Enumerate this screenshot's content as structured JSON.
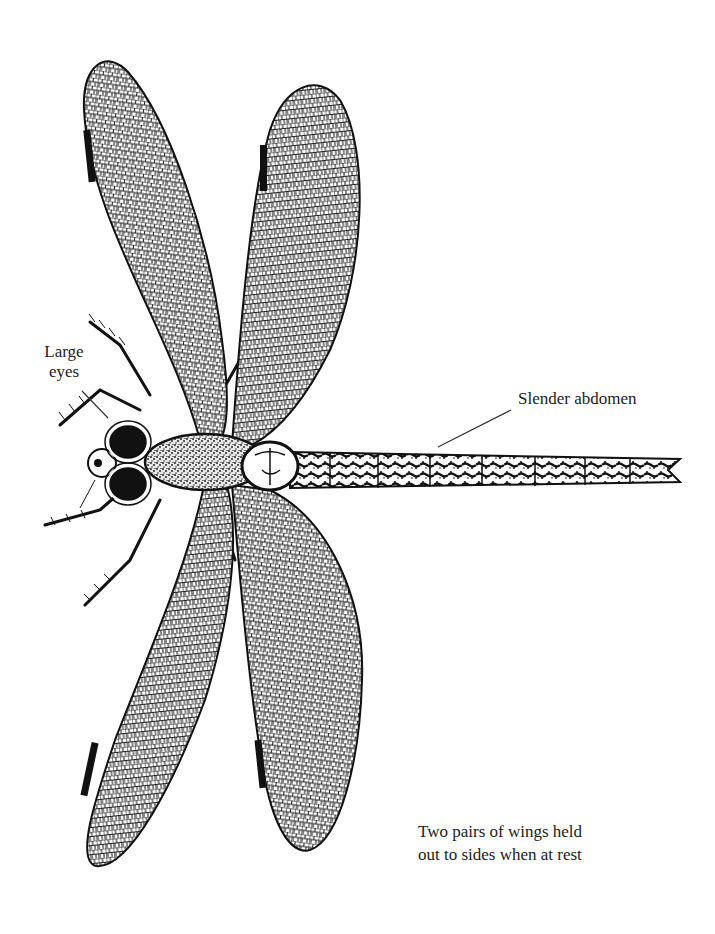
{
  "figure": {
    "colors": {
      "ink": "#111111",
      "background": "#ffffff",
      "label": "#222222"
    }
  },
  "labels": {
    "eyes": "Large\neyes",
    "abdomen": "Slender abdomen",
    "wings": "Two pairs of wings held\nout to sides when at rest"
  }
}
